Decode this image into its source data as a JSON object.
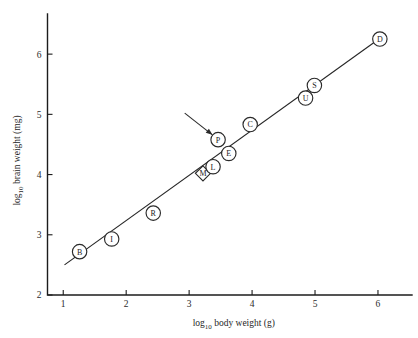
{
  "chart_data": {
    "type": "scatter",
    "title": "",
    "xlabel": "log10 body weight (g)",
    "ylabel": "log10 brain weight (mg)",
    "xlabel_base": "log",
    "xlabel_sub": "10",
    "xlabel_rest": " body weight (g)",
    "ylabel_base": "log",
    "ylabel_sub": "10",
    "ylabel_rest": " brain weight (mg)",
    "xlim": [
      0.75,
      6.35
    ],
    "ylim": [
      2.0,
      6.6
    ],
    "xticks": [
      1,
      2,
      3,
      4,
      5,
      6
    ],
    "yticks": [
      2,
      3,
      4,
      5,
      6
    ],
    "grid": false,
    "legend": "none",
    "points": [
      {
        "label": "B",
        "x": 1.26,
        "y": 2.72,
        "shape": "circle"
      },
      {
        "label": "I",
        "x": 1.77,
        "y": 2.93,
        "shape": "circle"
      },
      {
        "label": "R",
        "x": 2.43,
        "y": 3.36,
        "shape": "circle"
      },
      {
        "label": "M",
        "x": 3.22,
        "y": 4.02,
        "shape": "diamond"
      },
      {
        "label": "L",
        "x": 3.38,
        "y": 4.13,
        "shape": "circle"
      },
      {
        "label": "E",
        "x": 3.63,
        "y": 4.35,
        "shape": "circle"
      },
      {
        "label": "P",
        "x": 3.46,
        "y": 4.58,
        "shape": "circle"
      },
      {
        "label": "C",
        "x": 3.97,
        "y": 4.83,
        "shape": "circle"
      },
      {
        "label": "U",
        "x": 4.85,
        "y": 5.27,
        "shape": "circle"
      },
      {
        "label": "S",
        "x": 4.99,
        "y": 5.48,
        "shape": "circle"
      },
      {
        "label": "D",
        "x": 6.03,
        "y": 6.25,
        "shape": "circle"
      }
    ],
    "fit_line": {
      "x_start": 1.02,
      "y_start": 2.5,
      "x_end": 6.12,
      "y_end": 6.33
    },
    "annotations": [
      {
        "name": "arrow-to-P",
        "target_x": 3.37,
        "target_y": 4.66,
        "tail_x": 2.93,
        "tail_y": 5.02
      }
    ]
  },
  "colors": {
    "background": "#ffffff",
    "axis": "#1c1c1c",
    "marker_fill": "#ffffff",
    "marker_stroke": "#2a2a2a",
    "line": "#262626",
    "text": "#1f1f1f"
  }
}
